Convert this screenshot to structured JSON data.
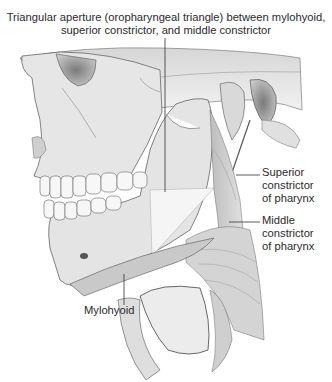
{
  "figure": {
    "title_line1": "Triangular aperture (oropharyngeal triangle) between mylohyoid,",
    "title_line2": "superior constrictor, and middle constrictor",
    "labels": {
      "superior_constrictor": [
        "Superior",
        "constrictor",
        "of pharynx"
      ],
      "middle_constrictor": [
        "Middle",
        "constrictor",
        "of pharynx"
      ],
      "mylohyoid": "Mylohyoid"
    },
    "colors": {
      "bone_light": "#e9e9e9",
      "bone_mid": "#c8c8c8",
      "shadow": "#8a8a8a",
      "outline": "#4a4a4a",
      "leader_line": "#333333"
    }
  }
}
